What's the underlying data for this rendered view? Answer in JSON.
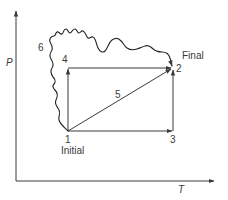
{
  "diagram": {
    "title": "",
    "axes": {
      "x_label": "T",
      "y_label": "P"
    },
    "points": [
      {
        "id": "1",
        "label": "1",
        "caption": "Initial"
      },
      {
        "id": "2",
        "label": "2",
        "caption": "Final"
      },
      {
        "id": "3",
        "label": "3",
        "caption": ""
      },
      {
        "id": "4",
        "label": "4",
        "caption": ""
      }
    ],
    "paths": [
      {
        "id": "1-4-2",
        "description": "isothermal rise 1→4 then isobaric heating 4→2"
      },
      {
        "id": "1-3-2",
        "description": "isobaric heating 1→3 then isothermal rise 3→2"
      },
      {
        "id": "5",
        "label": "5",
        "description": "straight path 1→2"
      },
      {
        "id": "6",
        "label": "6",
        "description": "arbitrary wavy path 1→2"
      }
    ],
    "colors": {
      "line": "#3a3a3a",
      "background": "#ffffff"
    }
  }
}
